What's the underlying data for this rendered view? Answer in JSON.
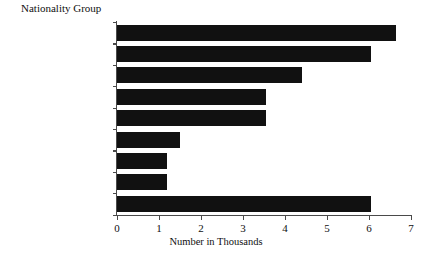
{
  "chart_data": {
    "type": "bar",
    "orientation": "horizontal",
    "title": "",
    "xlabel": "Number in Thousands",
    "ylabel": "Nationality Group",
    "categories": [
      "Latin American",
      "African",
      "Asian",
      "Other Nordic",
      "Other European",
      "North American",
      "Swedish",
      "Australian",
      "Unknown/Stateless"
    ],
    "values": [
      6.65,
      6.05,
      4.4,
      3.55,
      3.55,
      1.5,
      1.2,
      1.2,
      6.05
    ],
    "xlim": [
      0,
      7
    ],
    "xticks": [
      0,
      1,
      2,
      3,
      4,
      5,
      6,
      7
    ],
    "xtick_labels": [
      "0",
      "1",
      "2",
      "3",
      "4",
      "5",
      "6",
      "7"
    ],
    "grid": false,
    "legend": false,
    "bar_color": "#111111",
    "axis_color": "#4a4a4a",
    "background_color": "#ffffff"
  }
}
